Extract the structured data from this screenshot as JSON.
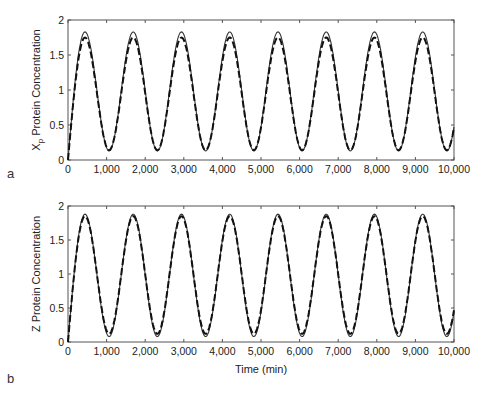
{
  "figure": {
    "panel_labels": [
      "a",
      "b"
    ],
    "x_axis_title": "Time (min)"
  },
  "chart_data": [
    {
      "type": "line",
      "panel": "a",
      "title": "",
      "ylabel": "Xp Protein Concentration",
      "ylabel_main": "X",
      "ylabel_sub": "p",
      "ylabel_rest": " Protein Concentration",
      "xlabel": "",
      "xlim": [
        0,
        10000
      ],
      "ylim": [
        0,
        2
      ],
      "xticks": [
        0,
        1000,
        2000,
        3000,
        4000,
        5000,
        6000,
        7000,
        8000,
        9000,
        10000
      ],
      "xtick_labels": [
        "0",
        "1,000",
        "2,000",
        "3,000",
        "4,000",
        "5,000",
        "6,000",
        "7,000",
        "8,000",
        "9,000",
        "10,000"
      ],
      "yticks": [
        0,
        0.5,
        1,
        1.5,
        2
      ],
      "ytick_labels": [
        "0",
        "0.5",
        "1",
        "1.5",
        "2"
      ],
      "grid": false,
      "legend": null,
      "period_min": 1250,
      "first_peak_min": 440,
      "peak_times": [
        440,
        1690,
        2940,
        4190,
        5440,
        6690,
        7940,
        9190
      ],
      "trough_times": [
        1065,
        2315,
        3565,
        4815,
        6065,
        7315,
        8565,
        9815
      ],
      "series": [
        {
          "name": "solid",
          "style": "solid",
          "color": "#333333",
          "start_value": 0.0,
          "peak": 1.83,
          "trough": 0.13
        },
        {
          "name": "dashed",
          "style": "dashed",
          "color": "#111111",
          "start_value": 0.0,
          "peak": 1.75,
          "trough": 0.14
        }
      ]
    },
    {
      "type": "line",
      "panel": "b",
      "title": "",
      "ylabel": "Z Protein Concentration",
      "ylabel_main": "Z Protein Concentration",
      "ylabel_sub": "",
      "ylabel_rest": "",
      "xlabel": "Time (min)",
      "xlim": [
        0,
        10000
      ],
      "ylim": [
        0,
        2
      ],
      "xticks": [
        0,
        1000,
        2000,
        3000,
        4000,
        5000,
        6000,
        7000,
        8000,
        9000,
        10000
      ],
      "xtick_labels": [
        "0",
        "1,000",
        "2,000",
        "3,000",
        "4,000",
        "5,000",
        "6,000",
        "7,000",
        "8,000",
        "9,000",
        "10,000"
      ],
      "yticks": [
        0,
        0.5,
        1,
        1.5,
        2
      ],
      "ytick_labels": [
        "0",
        "0.5",
        "1",
        "1.5",
        "2"
      ],
      "grid": false,
      "legend": null,
      "period_min": 1250,
      "first_peak_min": 440,
      "peak_times": [
        440,
        1690,
        2940,
        4190,
        5440,
        6690,
        7940,
        9190
      ],
      "trough_times": [
        1065,
        2315,
        3565,
        4815,
        6065,
        7315,
        8565,
        9815
      ],
      "series": [
        {
          "name": "solid",
          "style": "solid",
          "color": "#333333",
          "start_value": 0.0,
          "peak": 1.88,
          "trough": 0.08
        },
        {
          "name": "dashed",
          "style": "dashed",
          "color": "#111111",
          "start_value": 0.0,
          "peak": 1.85,
          "trough": 0.12
        }
      ]
    }
  ]
}
